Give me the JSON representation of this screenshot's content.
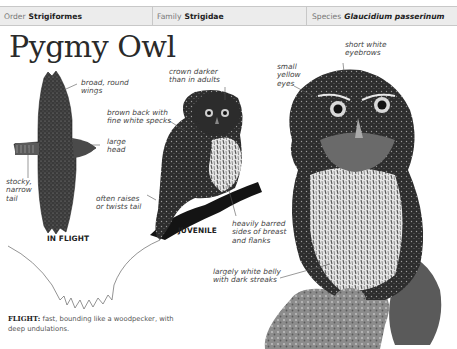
{
  "header": {
    "order_label": "Order",
    "order_value": "Strigiformes",
    "family_label": "Family",
    "family_value": "Strigidae",
    "species_label": "Species",
    "species_value": "Glaucidium passerinum"
  },
  "title": "Pygmy Owl",
  "annotations": {
    "broad_wings": "broad, round\nwings",
    "large_head": "large\nhead",
    "stocky_tail": "stocky,\nnarrow\ntail",
    "crown_darker": "crown darker\nthan in adults",
    "brown_back": "brown back with\nfine white specks",
    "raises_tail": "often raises\nor twists tail",
    "barred_sides": "heavily barred\nsides of breast\nand flanks",
    "short_eyebrows": "short white\neyebrows",
    "yellow_eyes": "small\nyellow\neyes",
    "white_belly": "largely white belly\nwith dark streaks"
  },
  "captions": {
    "in_flight": "IN FLIGHT",
    "juvenile": "JUVENILE"
  },
  "flight": {
    "label": "FLIGHT:",
    "text": " fast, bounding like a woodpecker, with deep undulations."
  },
  "colors": {
    "header_bg": "#ececec",
    "header_border": "#c8c8c8",
    "text_dark": "#222222",
    "owl_dark": "#2b2b2b"
  }
}
